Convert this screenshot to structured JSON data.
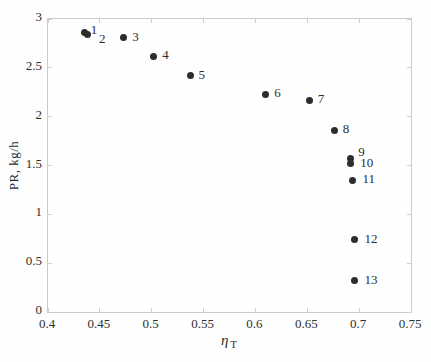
{
  "chart_data": {
    "type": "scatter",
    "title": "",
    "xlabel": "η",
    "xlabel_sub": "T",
    "ylabel": "PR, kg/h",
    "xlim": [
      0.4,
      0.75
    ],
    "ylim": [
      0,
      3
    ],
    "x_ticks": [
      0.4,
      0.45,
      0.5,
      0.55,
      0.6,
      0.65,
      0.7,
      0.75
    ],
    "x_tick_labels": [
      "0.4",
      "0.45",
      "0.5",
      "0.55",
      "0.6",
      "0.65",
      "0.7",
      "0.75"
    ],
    "y_ticks": [
      0,
      0.5,
      1,
      1.5,
      2,
      2.5,
      3
    ],
    "y_tick_labels": [
      "0",
      "0.5",
      "1",
      "1.5",
      "2",
      "2.5",
      "3"
    ],
    "grid": false,
    "legend": "none",
    "marker_color": "#2d2d2d",
    "axis_box_color": "#cbcbcb",
    "text_color": "#2e2e2e",
    "points": [
      {
        "label": "1",
        "x": 0.435,
        "y": 2.86,
        "dx": 3,
        "dy": -10
      },
      {
        "label": "2",
        "x": 0.438,
        "y": 2.84,
        "dx": 8,
        "dy": -3
      },
      {
        "label": "3",
        "x": 0.473,
        "y": 2.81,
        "dx": 5,
        "dy": -8
      },
      {
        "label": "4",
        "x": 0.502,
        "y": 2.62,
        "dx": 5,
        "dy": -8
      },
      {
        "label": "5",
        "x": 0.537,
        "y": 2.42,
        "dx": 5,
        "dy": -8
      },
      {
        "label": "6",
        "x": 0.61,
        "y": 2.23,
        "dx": 5,
        "dy": -8
      },
      {
        "label": "7",
        "x": 0.652,
        "y": 2.17,
        "dx": 5,
        "dy": -8
      },
      {
        "label": "8",
        "x": 0.676,
        "y": 1.86,
        "dx": 5,
        "dy": -8
      },
      {
        "label": "9",
        "x": 0.692,
        "y": 1.57,
        "dx": 4,
        "dy": -14
      },
      {
        "label": "10",
        "x": 0.692,
        "y": 1.52,
        "dx": 6,
        "dy": -8
      },
      {
        "label": "11",
        "x": 0.694,
        "y": 1.35,
        "dx": 6,
        "dy": -8
      },
      {
        "label": "12",
        "x": 0.696,
        "y": 0.74,
        "dx": 6,
        "dy": -8
      },
      {
        "label": "13",
        "x": 0.696,
        "y": 0.32,
        "dx": 6,
        "dy": -8
      }
    ]
  }
}
